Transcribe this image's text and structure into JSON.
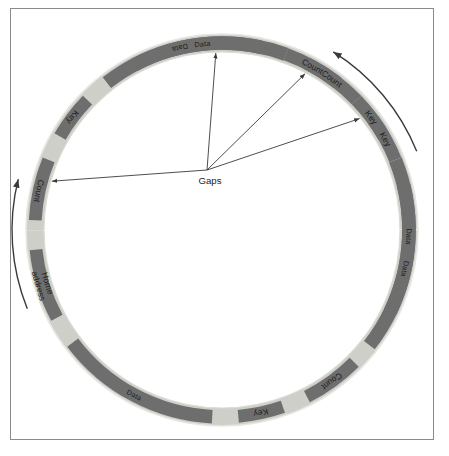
{
  "diagram": {
    "colors": {
      "frame_border": "#8a8a8a",
      "page_background": "#ffffff",
      "ring_gap": "#cfcfc9",
      "ring_data": "#6e6e6e",
      "label_box": "#6e6e6e",
      "label_text": "#1b1b1b",
      "arrow": "#3a3a3a"
    },
    "geometry": {
      "center_x": 222,
      "center_y": 230,
      "outer_radius": 196,
      "inner_radius": 178,
      "ring_thickness": 18
    },
    "gaps_callout": {
      "label": "Gaps",
      "x": 210,
      "y": 180,
      "origin_x": 207,
      "origin_y": 170,
      "arrow_count": 4
    },
    "rotation_arrows": [
      {
        "name": "rotation-arrow-top-right",
        "label": ""
      },
      {
        "name": "rotation-arrow-bottom-left",
        "label": ""
      }
    ],
    "segments": [
      {
        "type": "data",
        "label": "Data",
        "start": -118,
        "end": -70,
        "label_angle": -96,
        "two_line": false
      },
      {
        "type": "gap",
        "label": "",
        "start": -70,
        "end": -63,
        "label_angle": -66,
        "two_line": false
      },
      {
        "type": "box",
        "label": "Count",
        "start": -63,
        "end": -44,
        "label_angle": -54,
        "two_line": false
      },
      {
        "type": "gap",
        "label": "",
        "start": -44,
        "end": -36,
        "label_angle": -40,
        "two_line": false
      },
      {
        "type": "box",
        "label": "Key",
        "start": -36,
        "end": -22,
        "label_angle": -29,
        "two_line": false
      },
      {
        "type": "gap",
        "label": "",
        "start": -22,
        "end": -14,
        "label_angle": -18,
        "two_line": false
      },
      {
        "type": "data",
        "label": "Data",
        "start": -14,
        "end": 38,
        "label_angle": 12,
        "two_line": false
      },
      {
        "type": "gap",
        "label": "",
        "start": 38,
        "end": 45,
        "label_angle": 41,
        "two_line": false
      },
      {
        "type": "box",
        "label": "Count",
        "start": 45,
        "end": 63,
        "label_angle": 54,
        "two_line": false
      },
      {
        "type": "gap",
        "label": "",
        "start": 63,
        "end": 71,
        "label_angle": 67,
        "two_line": false
      },
      {
        "type": "box",
        "label": "Key",
        "start": 71,
        "end": 85,
        "label_angle": 78,
        "two_line": false
      },
      {
        "type": "gap",
        "label": "",
        "start": 85,
        "end": 93,
        "label_angle": 89,
        "two_line": false
      },
      {
        "type": "data",
        "label": "Data",
        "start": 93,
        "end": 143,
        "label_angle": 118,
        "two_line": false
      },
      {
        "type": "gap",
        "label": "",
        "start": 143,
        "end": 152,
        "label_angle": 147,
        "two_line": false
      },
      {
        "type": "box",
        "label": "Home address",
        "start": 152,
        "end": 174,
        "label_angle": 163,
        "two_line": true
      },
      {
        "type": "gap",
        "label": "",
        "start": 174,
        "end": 183,
        "label_angle": 178,
        "two_line": false
      },
      {
        "type": "box",
        "label": "Count",
        "start": 183,
        "end": 202,
        "label_angle": 192,
        "two_line": false
      },
      {
        "type": "gap",
        "label": "",
        "start": 202,
        "end": 210,
        "label_angle": 206,
        "two_line": false
      },
      {
        "type": "box",
        "label": "Key",
        "start": 210,
        "end": 224,
        "label_angle": 217,
        "two_line": false
      },
      {
        "type": "gap",
        "label": "",
        "start": 224,
        "end": 232,
        "label_angle": 228,
        "two_line": false
      },
      {
        "type": "data",
        "label": "Data",
        "start": 232,
        "end": 282,
        "label_angle": 257,
        "two_line": false
      },
      {
        "type": "gap",
        "label": "",
        "start": 282,
        "end": 290,
        "label_angle": 286,
        "two_line": false
      },
      {
        "type": "box",
        "label": "Count",
        "start": 290,
        "end": 308,
        "label_angle": 299,
        "two_line": false
      },
      {
        "type": "gap",
        "label": "",
        "start": 308,
        "end": 316,
        "label_angle": 312,
        "two_line": false
      },
      {
        "type": "box",
        "label": "Key",
        "start": 316,
        "end": 330,
        "label_angle": 323,
        "two_line": false
      },
      {
        "type": "gap",
        "label": "",
        "start": 330,
        "end": 338,
        "label_angle": 334,
        "two_line": false
      },
      {
        "type": "data",
        "label": "Data",
        "start": 338,
        "end": 386,
        "label_angle": 362,
        "two_line": false
      }
    ]
  }
}
